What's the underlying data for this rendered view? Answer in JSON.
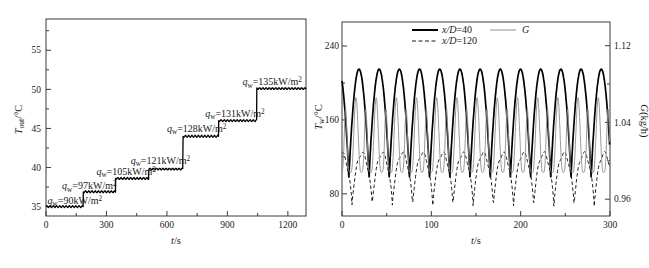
{
  "figure": {
    "cropped_top_text_present": true
  },
  "chart_data": [
    {
      "id": "outlet-temperature-steps",
      "type": "line",
      "xlabel": {
        "var": "t",
        "rest": "/s"
      },
      "ylabel": {
        "var": "T",
        "sub": "out",
        "rest": "/°C"
      },
      "x_range": [
        0,
        1290
      ],
      "y_range": [
        33.8,
        59.0
      ],
      "x_ticks": [
        {
          "v": 0,
          "label": "0"
        },
        {
          "v": 300,
          "label": "300"
        },
        {
          "v": 600,
          "label": "600"
        },
        {
          "v": 900,
          "label": "900"
        },
        {
          "v": 1200,
          "label": "1200"
        }
      ],
      "x_minor_ticks": [
        150,
        450,
        750,
        1050
      ],
      "y_ticks": [
        {
          "v": 35,
          "label": "35"
        },
        {
          "v": 40,
          "label": "40"
        },
        {
          "v": 45,
          "label": "45"
        },
        {
          "v": 50,
          "label": "50"
        },
        {
          "v": 55,
          "label": "55"
        }
      ],
      "y_minor_ticks": [
        37.5,
        42.5,
        47.5,
        52.5,
        57.5
      ],
      "grid": false,
      "line_color": "#000000",
      "ripple": {
        "amplitude_C": 0.13,
        "period_s": 16
      },
      "steps": [
        {
          "t_start": 0,
          "t_end": 185,
          "T": 35.0,
          "q_value": "90"
        },
        {
          "t_start": 185,
          "t_end": 345,
          "T": 36.9,
          "q_value": "97"
        },
        {
          "t_start": 345,
          "t_end": 510,
          "T": 38.6,
          "q_value": "105"
        },
        {
          "t_start": 510,
          "t_end": 680,
          "T": 39.8,
          "q_value": "121"
        },
        {
          "t_start": 680,
          "t_end": 857,
          "T": 44.0,
          "q_value": "128"
        },
        {
          "t_start": 857,
          "t_end": 1046,
          "T": 46.0,
          "q_value": "131"
        },
        {
          "t_start": 1046,
          "t_end": 1290,
          "T": 50.1,
          "q_value": "135"
        }
      ],
      "annotation_format": {
        "var": "q",
        "sub": "w",
        "eq": "=",
        "unit": "kW/m",
        "sup": "2"
      },
      "annotations": [
        {
          "value": "90",
          "t": 8,
          "T": 35.75
        },
        {
          "value": "97",
          "t": 80,
          "T": 37.65
        },
        {
          "value": "105",
          "t": 250,
          "T": 39.45
        },
        {
          "value": "121",
          "t": 420,
          "T": 40.85
        },
        {
          "value": "128",
          "t": 600,
          "T": 44.95
        },
        {
          "value": "131",
          "t": 790,
          "T": 46.95
        },
        {
          "value": "135",
          "t": 975,
          "T": 50.95
        }
      ]
    },
    {
      "id": "wall-temperature-oscillations",
      "type": "line",
      "xlabel": {
        "var": "t",
        "rest": "/s"
      },
      "ylabel_left": {
        "var": "T",
        "sub": "w",
        "rest": "/°C"
      },
      "ylabel_right": {
        "var": "G",
        "rest": "(kg/h)"
      },
      "x_range": [
        0,
        300
      ],
      "y_left_range": [
        56,
        266
      ],
      "y_right_range": [
        0.9425,
        1.1447
      ],
      "x_ticks": [
        {
          "v": 0,
          "label": "0"
        },
        {
          "v": 100,
          "label": "100"
        },
        {
          "v": 200,
          "label": "200"
        },
        {
          "v": 300,
          "label": "300"
        }
      ],
      "x_minor_ticks": [
        50,
        150,
        250
      ],
      "y_left_ticks": [
        {
          "v": 80,
          "label": "80"
        },
        {
          "v": 160,
          "label": "160"
        },
        {
          "v": 240,
          "label": "240"
        }
      ],
      "y_left_minor_ticks": [
        120,
        200
      ],
      "y_right_ticks": [
        {
          "v": 0.96,
          "label": "0.96"
        },
        {
          "v": 1.04,
          "label": "1.04"
        },
        {
          "v": 1.12,
          "label": "1.12"
        }
      ],
      "y_right_minor_ticks": [
        1.0,
        1.08
      ],
      "grid": false,
      "legend": [
        {
          "label": {
            "var": "x/D",
            "rest": "=40"
          },
          "style": "solid",
          "width": 2,
          "color": "#000000"
        },
        {
          "label": {
            "var": "x/D",
            "rest": "=120"
          },
          "style": "dashed",
          "width": 1,
          "color": "#1a1a1a"
        },
        {
          "label": {
            "var": "G",
            "rest": ""
          },
          "style": "solid",
          "width": 1,
          "color": "#8f8f8f"
        }
      ],
      "series": [
        {
          "name": "x/D=40",
          "axis": "left",
          "style": "solid",
          "width": 1.7,
          "color": "#000000",
          "waveform": {
            "kind": "rectified-cosine",
            "period": 22.6,
            "peak_t": 19,
            "min": 95,
            "max": 215,
            "sharpness": 0.85
          },
          "summary": {
            "period_s": 22.6,
            "min_T_C": 95,
            "max_T_C": 215,
            "peaks_count": 13
          }
        },
        {
          "name": "x/D=120",
          "axis": "left",
          "style": "dashed",
          "dash": "3.5 2.5",
          "width": 1,
          "color": "#1a1a1a",
          "waveform": {
            "kind": "rectified-cosine",
            "period": 22.6,
            "peak_t": 22.5,
            "min": 68,
            "max": 124,
            "sharpness": 0.75,
            "ripple_amp": 1.8,
            "ripple_period": 7.5
          },
          "summary": {
            "period_s": 22.6,
            "min_T_C": 68,
            "max_T_C": 124
          }
        },
        {
          "name": "G",
          "axis": "right",
          "style": "solid",
          "width": 0.9,
          "color": "#8f8f8f",
          "waveform": {
            "kind": "spikes",
            "period": 22.6,
            "min": 0.988,
            "max": 1.066,
            "components": [
              {
                "phase": 10,
                "pow": 2.5,
                "scale": 1.0
              },
              {
                "phase": 21,
                "pow": 6,
                "scale": 0.85
              }
            ]
          },
          "summary": {
            "period_s": 22.6,
            "min_G_kg_h": 0.988,
            "max_G_kg_h": 1.066
          }
        }
      ]
    }
  ]
}
